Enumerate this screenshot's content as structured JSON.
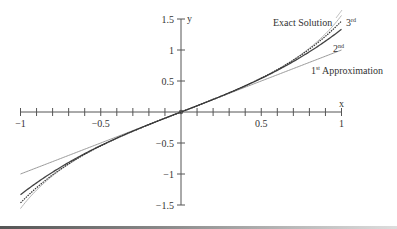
{
  "chart_data": {
    "type": "line",
    "title": "",
    "xlabel": "x",
    "ylabel": "y",
    "xlim": [
      -1,
      1
    ],
    "ylim": [
      -1.5,
      1.5
    ],
    "grid": false,
    "legend": "inline labels near right ends of curves",
    "x_ticks": [
      -1,
      -0.9,
      -0.8,
      -0.7,
      -0.6,
      -0.5,
      -0.4,
      -0.3,
      -0.2,
      -0.1,
      0,
      0.1,
      0.2,
      0.3,
      0.4,
      0.5,
      0.6,
      0.7,
      0.8,
      0.9,
      1
    ],
    "x_tick_labels": [
      {
        "value": -1,
        "label": "-1"
      },
      {
        "value": -0.5,
        "label": "-0.5"
      },
      {
        "value": 0.5,
        "label": "0.5"
      },
      {
        "value": 1,
        "label": "1"
      }
    ],
    "y_ticks": [
      -1.5,
      -1,
      -0.5,
      0.5,
      1,
      1.5
    ],
    "y_tick_labels": [
      {
        "value": 1.5,
        "label": "1.5"
      },
      {
        "value": 1,
        "label": "1"
      },
      {
        "value": 0.5,
        "label": "0.5"
      },
      {
        "value": -0.5,
        "label": "-0.5"
      },
      {
        "value": -1,
        "label": "-1"
      },
      {
        "value": -1.5,
        "label": "-1.5"
      }
    ],
    "x": [
      -1,
      -0.9,
      -0.8,
      -0.7,
      -0.6,
      -0.5,
      -0.4,
      -0.3,
      -0.2,
      -0.1,
      0,
      0.1,
      0.2,
      0.3,
      0.4,
      0.5,
      0.6,
      0.7,
      0.8,
      0.9,
      1
    ],
    "series": [
      {
        "name": "Exact Solution",
        "style": "solid light gray",
        "values": [
          -1.557,
          -1.26,
          -1.03,
          -0.842,
          -0.684,
          -0.546,
          -0.423,
          -0.309,
          -0.203,
          -0.1,
          0,
          0.1,
          0.203,
          0.309,
          0.423,
          0.546,
          0.684,
          0.842,
          1.03,
          1.26,
          1.557
        ]
      },
      {
        "name": "3rd",
        "style": "dashed dark",
        "values": [
          -1.467,
          -1.222,
          -1.016,
          -0.837,
          -0.682,
          -0.546,
          -0.423,
          -0.309,
          -0.203,
          -0.1,
          0,
          0.1,
          0.203,
          0.309,
          0.423,
          0.546,
          0.682,
          0.837,
          1.016,
          1.222,
          1.467
        ]
      },
      {
        "name": "2nd",
        "style": "solid dark",
        "values": [
          -1.333,
          -1.143,
          -0.971,
          -0.814,
          -0.672,
          -0.542,
          -0.421,
          -0.309,
          -0.203,
          -0.1,
          0,
          0.1,
          0.203,
          0.309,
          0.421,
          0.542,
          0.672,
          0.814,
          0.971,
          1.143,
          1.333
        ]
      },
      {
        "name": "1st Approximation",
        "style": "solid gray",
        "values": [
          -1,
          -0.9,
          -0.8,
          -0.7,
          -0.6,
          -0.5,
          -0.4,
          -0.3,
          -0.2,
          -0.1,
          0,
          0.1,
          0.2,
          0.3,
          0.4,
          0.5,
          0.6,
          0.7,
          0.8,
          0.9,
          1
        ]
      }
    ],
    "annotations": [
      {
        "text": "Exact Solution",
        "near": [
          0.75,
          1.4
        ]
      },
      {
        "text": "3rd",
        "near": [
          1.0,
          1.45
        ]
      },
      {
        "text": "2nd",
        "near": [
          0.95,
          1.2
        ]
      },
      {
        "text": "1st Approximation",
        "near": [
          0.95,
          0.8
        ]
      }
    ]
  },
  "labels": {
    "x_axis": "x",
    "y_axis": "y",
    "exact": "Exact Solution",
    "third_num": "3",
    "third_sup": "rd",
    "second_num": "2",
    "second_sup": "nd",
    "first_num": "1",
    "first_sup": "st",
    "first_rest": " Approximation"
  },
  "colors": {
    "axis": "#555555",
    "exact": "#b5b5b5",
    "third": "#333333",
    "second": "#444444",
    "first": "#9a9a9a"
  }
}
